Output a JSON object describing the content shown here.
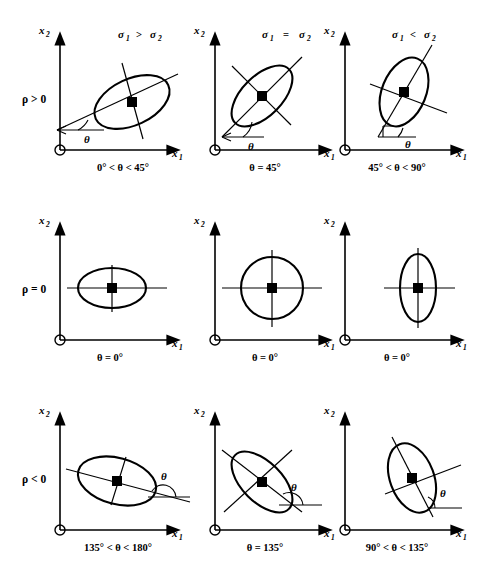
{
  "figure": {
    "type": "diagram",
    "axis_x_label": "x",
    "axis_x_sub": "1",
    "axis_y_label": "x",
    "axis_y_sub": "2",
    "theta_symbol": "θ"
  },
  "column_titles": [
    {
      "id": "col-sigma-greater",
      "sigma1": "σ",
      "sigma1_sub": "1",
      "relation": ">",
      "sigma2": "σ",
      "sigma2_sub": "2"
    },
    {
      "id": "col-sigma-equal",
      "sigma1": "σ",
      "sigma1_sub": "1",
      "relation": "=",
      "sigma2": "σ",
      "sigma2_sub": "2"
    },
    {
      "id": "col-sigma-less",
      "sigma1": "σ",
      "sigma1_sub": "1",
      "relation": "<",
      "sigma2": "σ",
      "sigma2_sub": "2"
    }
  ],
  "row_labels": [
    {
      "id": "row-rho-positive",
      "text": "ρ > 0"
    },
    {
      "id": "row-rho-zero",
      "text": "ρ = 0"
    },
    {
      "id": "row-rho-negative",
      "text": "ρ < 0"
    }
  ],
  "panels": [
    {
      "id": "panel-r1c1",
      "row": "ρ > 0",
      "column": "σ₁ > σ₂",
      "angle_caption": "0° < θ < 45°",
      "theta_label": "θ",
      "ellipse": {
        "rx": 40,
        "ry": 23,
        "rotation_deg": -25
      },
      "has_theta_arc": true
    },
    {
      "id": "panel-r1c2",
      "row": "ρ > 0",
      "column": "σ₁ = σ₂",
      "angle_caption": "θ = 45°",
      "theta_label": "θ",
      "ellipse": {
        "rx": 38,
        "ry": 20,
        "rotation_deg": -45
      },
      "has_theta_arc": true
    },
    {
      "id": "panel-r1c3",
      "row": "ρ > 0",
      "column": "σ₁ < σ₂",
      "angle_caption": "45° < θ < 90°",
      "theta_label": "θ",
      "ellipse": {
        "rx": 36,
        "ry": 22,
        "rotation_deg": -68
      },
      "has_theta_arc": true
    },
    {
      "id": "panel-r2c1",
      "row": "ρ = 0",
      "column": "σ₁ > σ₂",
      "angle_caption": "θ = 0°",
      "theta_label": "",
      "ellipse": {
        "rx": 34,
        "ry": 20,
        "rotation_deg": 0
      },
      "has_theta_arc": false
    },
    {
      "id": "panel-r2c2",
      "row": "ρ = 0",
      "column": "σ₁ = σ₂",
      "angle_caption": "θ = 0°",
      "theta_label": "",
      "ellipse": {
        "rx": 31,
        "ry": 31,
        "rotation_deg": 0
      },
      "has_theta_arc": false
    },
    {
      "id": "panel-r2c3",
      "row": "ρ = 0",
      "column": "σ₁ < σ₂",
      "angle_caption": "θ = 0°",
      "theta_label": "",
      "ellipse": {
        "rx": 18,
        "ry": 34,
        "rotation_deg": 0
      },
      "has_theta_arc": false
    },
    {
      "id": "panel-r3c1",
      "row": "ρ < 0",
      "column": "σ₁ > σ₂",
      "angle_caption": "135° < θ < 180°",
      "theta_label": "θ",
      "ellipse": {
        "rx": 40,
        "ry": 23,
        "rotation_deg": 15
      },
      "has_theta_arc": true
    },
    {
      "id": "panel-r3c2",
      "row": "ρ < 0",
      "column": "σ₁ = σ₂",
      "angle_caption": "θ = 135°",
      "theta_label": "θ",
      "ellipse": {
        "rx": 38,
        "ry": 20,
        "rotation_deg": 45
      },
      "has_theta_arc": true
    },
    {
      "id": "panel-r3c3",
      "row": "ρ < 0",
      "column": "σ₁ < σ₂",
      "angle_caption": "90° < θ < 135°",
      "theta_label": "θ",
      "ellipse": {
        "rx": 36,
        "ry": 22,
        "rotation_deg": 70
      },
      "has_theta_arc": true
    }
  ],
  "colors": {
    "ink": "#000000",
    "background": "#ffffff"
  }
}
